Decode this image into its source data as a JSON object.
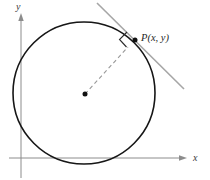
{
  "figure": {
    "labels": {
      "y_axis": "y",
      "x_axis": "x",
      "point": "P(x, y)"
    },
    "colors": {
      "background": "#ffffff",
      "axis": "#8c8c8c",
      "axis_label": "#3a3a3a",
      "circle": "#161616",
      "center_dot": "#111111",
      "point_dot": "#111111",
      "dashed_radius": "#999999",
      "tangent_line": "#a6a6a6",
      "right_angle_marker": "#2b2b2b",
      "point_label": "#1f1f1f"
    }
  }
}
